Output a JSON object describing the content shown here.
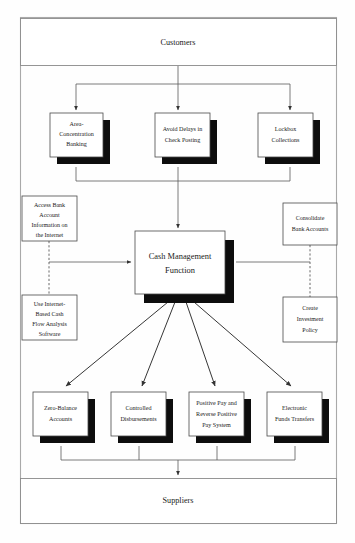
{
  "diagram": {
    "colors": {
      "background": "#ffffff",
      "box_fill": "#ffffff",
      "box_stroke": "#4a4a4a",
      "shadow": "#0d0d0d",
      "connector": "#5a5a5a",
      "outer_frame": "#a9a9a9",
      "text": "#1a1a1a"
    },
    "outer_frame": {
      "x": 20,
      "y": 17,
      "width": 317,
      "height": 507
    },
    "nodes": {
      "customers": {
        "label": "Customers",
        "type": "wide-terminal",
        "x": 20,
        "y": 18,
        "width": 317,
        "height": 48
      },
      "suppliers": {
        "label": "Suppliers",
        "type": "wide-terminal",
        "x": 20,
        "y": 478,
        "width": 317,
        "height": 46
      },
      "center": {
        "label_line1": "Cash Management",
        "label_line2": "Function",
        "type": "process-shadowed",
        "x": 135,
        "y": 231,
        "width": 90,
        "height": 63
      },
      "inflow": [
        {
          "id": "area-concentration-banking",
          "lines": [
            "Area-",
            "Concentration",
            "Banking"
          ],
          "x": 50,
          "y": 113,
          "width": 53,
          "height": 44
        },
        {
          "id": "avoid-delays-in-check-posting",
          "lines": [
            "Avoid Delays in",
            "Check Posting"
          ],
          "x": 155,
          "y": 113,
          "width": 55,
          "height": 44
        },
        {
          "id": "lockbox-collections",
          "lines": [
            "Lockbox",
            "Collections"
          ],
          "x": 258,
          "y": 113,
          "width": 55,
          "height": 44
        }
      ],
      "outflow": [
        {
          "id": "zero-balance-accounts",
          "lines": [
            "Zero-Balance",
            "Accounts"
          ],
          "x": 33,
          "y": 392,
          "width": 55,
          "height": 44
        },
        {
          "id": "controlled-disbursements",
          "lines": [
            "Controlled",
            "Disbursements"
          ],
          "x": 111,
          "y": 392,
          "width": 55,
          "height": 44
        },
        {
          "id": "positive-pay-and-reverse-positive-pay-system",
          "lines": [
            "Positive Pay and",
            "Reverse Positive",
            "Pay System"
          ],
          "x": 189,
          "y": 392,
          "width": 55,
          "height": 44
        },
        {
          "id": "electronic-funds-transfers",
          "lines": [
            "Electronic",
            "Funds Transfers"
          ],
          "x": 267,
          "y": 392,
          "width": 55,
          "height": 44
        }
      ],
      "side_left": [
        {
          "id": "access-bank-account-information-on-the-internet",
          "lines": [
            "Access Bank",
            "Account",
            "Information on",
            "the Internet"
          ],
          "x": 22,
          "y": 196,
          "width": 55,
          "height": 45
        },
        {
          "id": "use-internet-based-cash-flow-analysis-software",
          "lines": [
            "Use Internet-",
            "Based Cash",
            "Flow Analysis",
            "Software"
          ],
          "x": 22,
          "y": 295,
          "width": 55,
          "height": 45
        }
      ],
      "side_right": [
        {
          "id": "consolidate-bank-accounts",
          "lines": [
            "Consolidate",
            "Bank Accounts"
          ],
          "x": 283,
          "y": 203,
          "width": 54,
          "height": 42
        },
        {
          "id": "create-investment-policy",
          "lines": [
            "Create",
            "Investment",
            "Policy"
          ],
          "x": 283,
          "y": 297,
          "width": 54,
          "height": 45
        }
      ]
    },
    "edges": [
      {
        "from": "customers",
        "to": "inflow-boxes",
        "style": "solid-arrow"
      },
      {
        "from": "inflow-boxes",
        "to": "center",
        "style": "solid-arrow"
      },
      {
        "from": "center",
        "to": "outflow-boxes",
        "style": "solid-arrow-fan"
      },
      {
        "from": "outflow-boxes",
        "to": "suppliers",
        "style": "solid-arrow"
      },
      {
        "from": "side-left-group",
        "to": "center",
        "style": "solid-arrow"
      },
      {
        "from": "center",
        "to": "side-right-group",
        "style": "solid-line"
      },
      {
        "from": "access-bank-account-information-on-the-internet",
        "to": "use-internet-based-cash-flow-analysis-software",
        "style": "dashed"
      },
      {
        "from": "consolidate-bank-accounts",
        "to": "create-investment-policy",
        "style": "dashed"
      }
    ]
  }
}
